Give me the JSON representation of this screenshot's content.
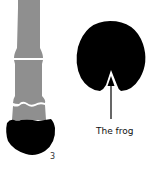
{
  "figure": {
    "leg_label": "3",
    "frog_label": "The frog",
    "colors": {
      "bone": "#8f8f8f",
      "hoof": "#000000",
      "background": "#ffffff"
    }
  }
}
